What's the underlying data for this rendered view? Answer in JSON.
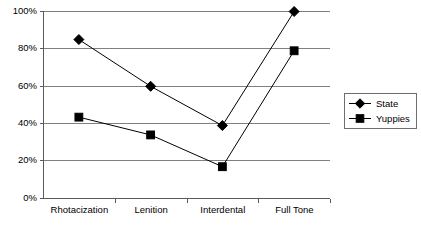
{
  "chart_data": {
    "type": "line",
    "title": "",
    "subtitle": "",
    "xlabel": "",
    "ylabel": "",
    "categories": [
      "Rhotacization",
      "Lenition",
      "Interdental",
      "Full Tone"
    ],
    "series": [
      {
        "name": "State",
        "marker": "diamond",
        "color": "#000000",
        "values": [
          85,
          60,
          39,
          100
        ]
      },
      {
        "name": "Yuppies",
        "marker": "square",
        "color": "#000000",
        "values": [
          43.5,
          34,
          17,
          79
        ]
      }
    ],
    "ylim": [
      0,
      100
    ],
    "ytick_values": [
      0,
      20,
      40,
      60,
      80,
      100
    ],
    "ytick_labels": [
      "0%",
      "20%",
      "40%",
      "60%",
      "80%",
      "100%"
    ],
    "grid": true,
    "grid_axis": "y",
    "legend_position": "right",
    "legend_entries": [
      "State",
      "Yuppies"
    ],
    "colors": {
      "gridline": "#808080",
      "axis": "#5a5a5a",
      "series": "#000000",
      "legend_border": "#6e6e6e",
      "background": "#ffffff"
    }
  },
  "axes": {
    "y_labels": [
      "100%",
      "80%",
      "60%",
      "40%",
      "20%",
      "0%"
    ],
    "x_labels": [
      "Rhotacization",
      "Lenition",
      "Interdental",
      "Full Tone"
    ]
  },
  "legend": {
    "items": [
      {
        "label": "State"
      },
      {
        "label": "Yuppies"
      }
    ]
  }
}
